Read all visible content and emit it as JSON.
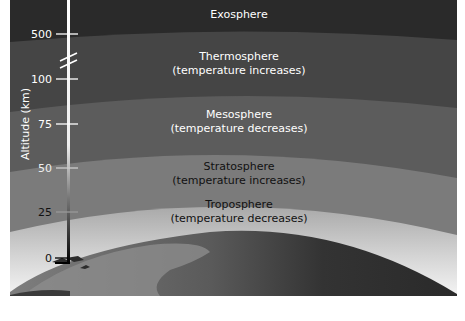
{
  "diagram": {
    "axis_title": "Altitude (km)",
    "ticks": [
      "500",
      "100",
      "75",
      "50",
      "25",
      "0"
    ],
    "layers": [
      {
        "name": "Exosphere",
        "note": ""
      },
      {
        "name": "Thermosphere",
        "note": "(temperature increases)"
      },
      {
        "name": "Mesosphere",
        "note": "(temperature decreases)"
      },
      {
        "name": "Stratosphere",
        "note": "(temperature increases)"
      },
      {
        "name": "Troposphere",
        "note": "(temperature decreases)"
      }
    ],
    "colors": {
      "exosphere": "#2b2b2b",
      "thermosphere": "#474747",
      "mesosphere": "#5f5f5f",
      "stratosphere": "#7d7d7d",
      "troposphere_top": "#a8a8a8",
      "troposphere_bottom": "#f2f2f2",
      "earth_land": "#8a8a8a",
      "earth_ocean": "#3a3a3a"
    }
  }
}
